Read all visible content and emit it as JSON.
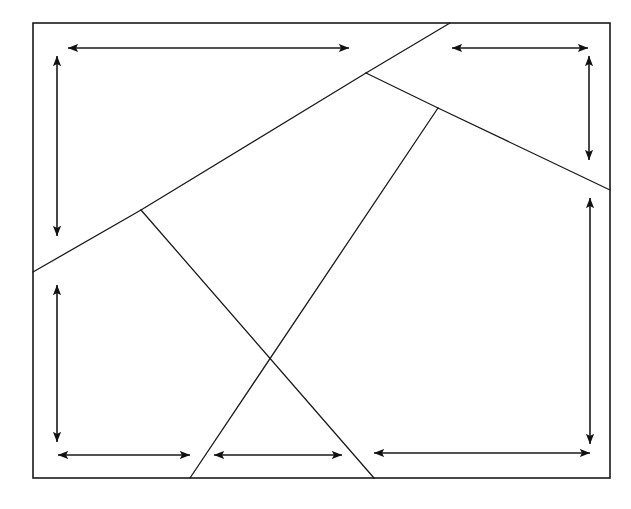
{
  "figure": {
    "width": 631,
    "height": 509,
    "background_color": "#ffffff",
    "stroke_color": "#1a1a1a",
    "border_stroke_width": 1.6,
    "line_stroke_width": 1.3,
    "arrow_stroke_width": 1.6
  },
  "border": {
    "name": "outer-rectangle",
    "x1": 33,
    "y1": 23,
    "x2": 610,
    "y2": 478
  },
  "vertices": {
    "junction_a": {
      "label": "A",
      "x": 141,
      "y": 210
    },
    "junction_b": {
      "label": "B",
      "x": 366,
      "y": 73
    },
    "junction_c": {
      "label": "C",
      "x": 438,
      "y": 108
    },
    "crossing_x": {
      "label": "X",
      "x": 270,
      "y": 358
    },
    "left_edge_anchor": {
      "label": "L",
      "x": 33,
      "y": 272
    },
    "top_edge_anchor": {
      "label": "T",
      "x": 450,
      "y": 23
    },
    "right_edge_anchor": {
      "label": "R",
      "x": 610,
      "y": 190
    },
    "bottom_left_anchor": {
      "label": "B1",
      "x": 190,
      "y": 478
    },
    "bottom_right_anchor": {
      "label": "B2",
      "x": 374,
      "y": 478
    }
  },
  "segments": [
    {
      "name": "segment-left-edge-to-a",
      "x1": 33,
      "y1": 272,
      "x2": 141,
      "y2": 210
    },
    {
      "name": "segment-a-to-b",
      "x1": 141,
      "y1": 210,
      "x2": 366,
      "y2": 73
    },
    {
      "name": "segment-b-to-top-edge",
      "x1": 366,
      "y1": 73,
      "x2": 450,
      "y2": 23
    },
    {
      "name": "segment-b-to-c",
      "x1": 366,
      "y1": 73,
      "x2": 438,
      "y2": 108
    },
    {
      "name": "segment-c-to-right-edge",
      "x1": 438,
      "y1": 108,
      "x2": 610,
      "y2": 190
    },
    {
      "name": "segment-a-to-bottom-right-anchor",
      "x1": 141,
      "y1": 210,
      "x2": 374,
      "y2": 478
    },
    {
      "name": "segment-c-to-bottom-left-anchor",
      "x1": 438,
      "y1": 108,
      "x2": 190,
      "y2": 478
    }
  ],
  "arrows": [
    {
      "name": "arrow-top-left-horizontal",
      "orientation": "horizontal",
      "x1": 68,
      "y1": 48,
      "x2": 349,
      "y2": 48,
      "length_px": 281
    },
    {
      "name": "arrow-top-right-horizontal",
      "orientation": "horizontal",
      "x1": 452,
      "y1": 48,
      "x2": 588,
      "y2": 48,
      "length_px": 136
    },
    {
      "name": "arrow-left-upper-vertical",
      "orientation": "vertical",
      "x1": 57,
      "y1": 56,
      "x2": 57,
      "y2": 236,
      "length_px": 180
    },
    {
      "name": "arrow-right-upper-vertical",
      "orientation": "vertical",
      "x1": 589,
      "y1": 56,
      "x2": 589,
      "y2": 160,
      "length_px": 104
    },
    {
      "name": "arrow-left-lower-vertical",
      "orientation": "vertical",
      "x1": 57,
      "y1": 285,
      "x2": 57,
      "y2": 442,
      "length_px": 157
    },
    {
      "name": "arrow-right-lower-vertical",
      "orientation": "vertical",
      "x1": 590,
      "y1": 198,
      "x2": 590,
      "y2": 444,
      "length_px": 246
    },
    {
      "name": "arrow-bottom-left-horizontal",
      "orientation": "horizontal",
      "x1": 58,
      "y1": 455,
      "x2": 190,
      "y2": 455,
      "length_px": 132
    },
    {
      "name": "arrow-bottom-middle-horizontal",
      "orientation": "horizontal",
      "x1": 214,
      "y1": 455,
      "x2": 342,
      "y2": 455,
      "length_px": 128
    },
    {
      "name": "arrow-bottom-right-horizontal",
      "orientation": "horizontal",
      "x1": 374,
      "y1": 453,
      "x2": 590,
      "y2": 453,
      "length_px": 216
    }
  ]
}
